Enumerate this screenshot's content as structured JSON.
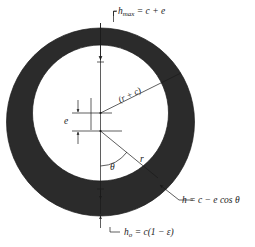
{
  "figure": {
    "type": "journal-bearing-clearance-diagram",
    "colors": {
      "bearing_fill": "#2b2b2b",
      "background": "#ffffff",
      "line": "#1a1a1a"
    },
    "geometry": {
      "outer_circle": {
        "cx": 100.5,
        "cy": 122.0,
        "r": 94.0
      },
      "inner_circle": {
        "cx": 100.5,
        "cy": 113.0,
        "r": 68.0
      },
      "eccentricity_px": 9.0,
      "journal_center": {
        "cx": 100.5,
        "cy": 113.0
      },
      "bearing_center": {
        "cx": 100.5,
        "cy": 131.0
      },
      "theta_deg": 38
    }
  },
  "labels": {
    "h_max": {
      "symbol": "h",
      "subscript": "max",
      "equation": "= c + e",
      "full": "h_max = c + e"
    },
    "h_min": {
      "symbol": "h",
      "subscript": "o",
      "equation": "= c(1 − ε)",
      "full": "h_o = c(1 − ε)"
    },
    "h_theta": {
      "full": "h = c − e cos θ"
    },
    "eccentricity": {
      "full": "e"
    },
    "angle": {
      "full": "θ"
    },
    "radius": {
      "full": "r"
    },
    "radius_plus_clearance": {
      "full": "(r + c)"
    }
  }
}
